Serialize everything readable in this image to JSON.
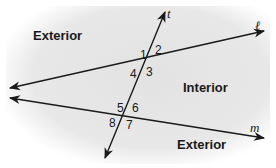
{
  "regions": {
    "exterior_top": "Exterior",
    "interior": "Interior",
    "exterior_bottom": "Exterior"
  },
  "lines": {
    "transversal": "t",
    "top": "ℓ",
    "bottom": "m"
  },
  "angles": [
    "1",
    "2",
    "3",
    "4",
    "5",
    "6",
    "7",
    "8"
  ],
  "colors": {
    "background_shade": "#e6e6e6",
    "line": "#1a1a1a"
  }
}
